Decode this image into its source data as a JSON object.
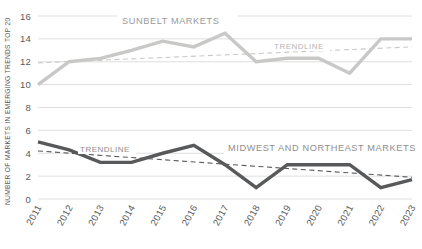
{
  "chart_data": {
    "type": "line",
    "title": "",
    "xlabel": "",
    "ylabel": "NUMBER OF MARKETS IN EMERGING TRENDS TOP 20",
    "ylim": [
      0,
      16
    ],
    "ytick_step": 2,
    "grid": true,
    "legend_position": "inline-annotation",
    "categories": [
      "2011",
      "2012",
      "2013",
      "2014",
      "2015",
      "2016",
      "2017",
      "2018",
      "2019",
      "2020",
      "2021",
      "2022",
      "2023"
    ],
    "x": [
      2011,
      2012,
      2013,
      2014,
      2015,
      2016,
      2017,
      2018,
      2019,
      2020,
      2021,
      2022,
      2023
    ],
    "yticks": [
      0,
      2,
      4,
      6,
      8,
      10,
      12,
      14,
      16
    ],
    "ytick_labels": [
      "0",
      "2",
      "4",
      "6",
      "8",
      "10",
      "12",
      "14",
      "16"
    ],
    "series": [
      {
        "name": "SUNBELT MARKETS",
        "color": "#c8c9c7",
        "values": [
          10,
          12,
          12.3,
          13,
          13.8,
          13.3,
          14.5,
          12,
          12.3,
          12.3,
          11,
          14,
          14
        ],
        "label": "SUNBELT MARKETS",
        "trendline": {
          "label": "TRENDLINE",
          "color": "#c8c9c7",
          "style": "dashed",
          "start_value": 11.9,
          "end_value": 13.3
        }
      },
      {
        "name": "MIDWEST AND NORTHEAST MARKETS",
        "color": "#58595b",
        "values": [
          5,
          4.3,
          3.2,
          3.2,
          4,
          4.7,
          3,
          1,
          3,
          3,
          3,
          1,
          1.7
        ],
        "label": "MIDWEST AND NORTHEAST MARKETS",
        "trendline": {
          "label": "TRENDLINE",
          "color": "#58595b",
          "style": "dashed",
          "start_value": 4.2,
          "end_value": 1.9
        }
      }
    ]
  },
  "labels": {
    "y_axis_title": "NUMBER OF MARKETS IN EMERGING TRENDS TOP 20",
    "sunbelt_label": "SUNBELT MARKETS",
    "midwest_label": "MIDWEST AND NORTHEAST MARKETS",
    "trendline_upper": "TRENDLINE",
    "trendline_lower": "TRENDLINE"
  },
  "colors": {
    "sunbelt": "#c8c9c7",
    "midwest": "#58595b",
    "grid": "#d9dadb",
    "text": "#58595b",
    "background": "#ffffff"
  }
}
